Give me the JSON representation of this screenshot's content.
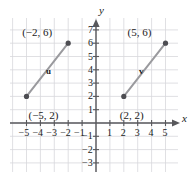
{
  "figure": {
    "type": "coordinate-plane-vector-diagram",
    "axis_labels": {
      "x": "x",
      "y": "y"
    },
    "grid": {
      "visible": true,
      "color": "#d8d8dc",
      "spacing_units": 1
    },
    "axis_color": "#58585c",
    "x_ticks": [
      "-5",
      "-4",
      "-3",
      "-2",
      "-1",
      "1",
      "2",
      "3",
      "4",
      "5"
    ],
    "y_ticks": [
      "7",
      "6",
      "5",
      "4",
      "3",
      "2",
      "1",
      "-1",
      "-2",
      "-3"
    ],
    "xlim": [
      -6,
      6
    ],
    "ylim": [
      -3.5,
      7.8
    ],
    "vector_color": "#9a9a9e",
    "point_color": "#4d4d52",
    "vectors": [
      {
        "name": "u",
        "name_x": -3.6,
        "name_y": 4.2,
        "start": {
          "x": -5,
          "y": 2,
          "label": "(−5, 2)",
          "label_dx": 2,
          "label_dy": 14
        },
        "end": {
          "x": -2,
          "y": 6,
          "label": "(−2, 6)",
          "label_dx": -46,
          "label_dy": -16
        }
      },
      {
        "name": "v",
        "name_x": 3.1,
        "name_y": 4.2,
        "start": {
          "x": 2,
          "y": 2,
          "label": "(2, 2)",
          "label_dx": -4,
          "label_dy": 14
        },
        "end": {
          "x": 5,
          "y": 6,
          "label": "(5, 6)",
          "label_dx": -38,
          "label_dy": -16
        }
      }
    ]
  }
}
